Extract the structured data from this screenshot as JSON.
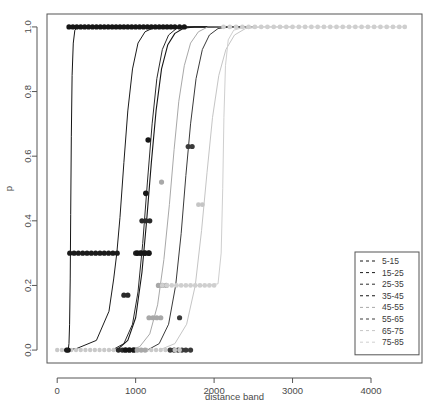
{
  "chart_data": {
    "type": "line",
    "title": "",
    "xlabel": "distance band",
    "ylabel": "p",
    "xlim": [
      -130,
      4650
    ],
    "ylim": [
      -0.04,
      1.04
    ],
    "xticks": [
      0,
      1000,
      2000,
      3000,
      4000
    ],
    "xtick_labels": [
      "0",
      "1000",
      "2000",
      "3000",
      "4000"
    ],
    "yticks": [
      0.0,
      0.2,
      0.4,
      0.6,
      0.8,
      1.0
    ],
    "ytick_labels": [
      "0.0",
      "0.2",
      "0.4",
      "0.6",
      "0.8",
      "1.0"
    ],
    "grid": false,
    "legend_position": "bottom-right",
    "legend_title": "",
    "series": [
      {
        "name": "5-15",
        "color": "#151515",
        "dash": "3,3",
        "linewidth": 1.0,
        "point_color": "#151515",
        "point_size": 2.6,
        "curve": [
          [
            140,
            0.0
          ],
          [
            150,
            0.02
          ],
          [
            158,
            0.08
          ],
          [
            166,
            0.22
          ],
          [
            172,
            0.42
          ],
          [
            180,
            0.66
          ],
          [
            190,
            0.85
          ],
          [
            205,
            0.95
          ],
          [
            225,
            0.99
          ],
          [
            260,
            1.0
          ],
          [
            400,
            1.0
          ],
          [
            900,
            1.0
          ],
          [
            1600,
            1.0
          ],
          [
            2400,
            1.0
          ]
        ],
        "points": [
          [
            150,
            1.0
          ],
          [
            200,
            1.0
          ],
          [
            250,
            1.0
          ],
          [
            300,
            1.0
          ],
          [
            350,
            1.0
          ],
          [
            400,
            1.0
          ],
          [
            450,
            1.0
          ],
          [
            500,
            1.0
          ],
          [
            550,
            1.0
          ],
          [
            600,
            1.0
          ],
          [
            650,
            1.0
          ],
          [
            700,
            1.0
          ],
          [
            750,
            1.0
          ],
          [
            800,
            1.0
          ],
          [
            850,
            1.0
          ],
          [
            900,
            1.0
          ],
          [
            950,
            1.0
          ],
          [
            1000,
            1.0
          ],
          [
            1050,
            1.0
          ],
          [
            1100,
            1.0
          ],
          [
            1150,
            1.0
          ],
          [
            1200,
            1.0
          ],
          [
            1250,
            1.0
          ],
          [
            1300,
            1.0
          ],
          [
            1350,
            1.0
          ],
          [
            1400,
            1.0
          ],
          [
            1450,
            1.0
          ],
          [
            1500,
            1.0
          ],
          [
            1560,
            1.0
          ],
          [
            1620,
            1.0
          ],
          [
            140,
            0.0
          ]
        ]
      },
      {
        "name": "15-25",
        "color": "#1b1b1b",
        "dash": "3,3",
        "linewidth": 1.0,
        "point_color": "#1b1b1b",
        "point_size": 2.6,
        "curve": [
          [
            120,
            0.0
          ],
          [
            250,
            0.005
          ],
          [
            500,
            0.03
          ],
          [
            660,
            0.12
          ],
          [
            720,
            0.22
          ],
          [
            760,
            0.3
          ],
          [
            800,
            0.41
          ],
          [
            850,
            0.58
          ],
          [
            900,
            0.74
          ],
          [
            960,
            0.87
          ],
          [
            1030,
            0.95
          ],
          [
            1120,
            0.985
          ],
          [
            1250,
            1.0
          ],
          [
            1600,
            1.0
          ],
          [
            2200,
            1.0
          ]
        ],
        "points": [
          [
            160,
            0.3
          ],
          [
            215,
            0.3
          ],
          [
            270,
            0.3
          ],
          [
            325,
            0.3
          ],
          [
            380,
            0.3
          ],
          [
            435,
            0.3
          ],
          [
            490,
            0.3
          ],
          [
            545,
            0.3
          ],
          [
            600,
            0.3
          ],
          [
            655,
            0.3
          ],
          [
            710,
            0.3
          ],
          [
            765,
            0.3
          ],
          [
            120,
            0.0
          ]
        ]
      },
      {
        "name": "25-35",
        "color": "#2a2a2a",
        "dash": "3,3",
        "linewidth": 1.0,
        "point_color": "#2a2a2a",
        "point_size": 2.6,
        "curve": [
          [
            700,
            0.0
          ],
          [
            850,
            0.02
          ],
          [
            960,
            0.08
          ],
          [
            1030,
            0.18
          ],
          [
            1090,
            0.33
          ],
          [
            1150,
            0.52
          ],
          [
            1210,
            0.7
          ],
          [
            1270,
            0.84
          ],
          [
            1340,
            0.93
          ],
          [
            1420,
            0.975
          ],
          [
            1520,
            0.995
          ],
          [
            1650,
            1.0
          ],
          [
            2000,
            1.0
          ]
        ],
        "points": [
          [
            850,
            0.17
          ],
          [
            900,
            0.17
          ],
          [
            1080,
            0.4
          ],
          [
            1130,
            0.4
          ],
          [
            1180,
            0.4
          ],
          [
            1000,
            0.3
          ],
          [
            1055,
            0.3
          ],
          [
            1110,
            0.3
          ],
          [
            1165,
            0.3
          ],
          [
            780,
            0.0
          ],
          [
            830,
            0.0
          ]
        ]
      },
      {
        "name": "35-45",
        "color": "#161616",
        "dash": "3,3",
        "linewidth": 1.1,
        "point_color": "#161616",
        "point_size": 2.8,
        "curve": [
          [
            760,
            0.0
          ],
          [
            900,
            0.03
          ],
          [
            1000,
            0.1
          ],
          [
            1080,
            0.24
          ],
          [
            1140,
            0.4
          ],
          [
            1200,
            0.58
          ],
          [
            1260,
            0.74
          ],
          [
            1330,
            0.87
          ],
          [
            1410,
            0.945
          ],
          [
            1500,
            0.98
          ],
          [
            1610,
            0.996
          ],
          [
            1750,
            1.0
          ],
          [
            2050,
            1.0
          ]
        ],
        "points": [
          [
            1160,
            0.65
          ],
          [
            1130,
            0.485
          ],
          [
            1020,
            0.3
          ],
          [
            1070,
            0.3
          ],
          [
            1120,
            0.3
          ],
          [
            1170,
            0.3
          ],
          [
            870,
            0.0
          ],
          [
            920,
            0.0
          ],
          [
            975,
            0.0
          ]
        ]
      },
      {
        "name": "45-55",
        "color": "#a8a8a8",
        "dash": "3,3",
        "linewidth": 1.0,
        "point_color": "#a8a8a8",
        "point_size": 2.6,
        "curve": [
          [
            900,
            0.0
          ],
          [
            1050,
            0.01
          ],
          [
            1180,
            0.05
          ],
          [
            1280,
            0.14
          ],
          [
            1360,
            0.28
          ],
          [
            1430,
            0.45
          ],
          [
            1490,
            0.62
          ],
          [
            1550,
            0.77
          ],
          [
            1620,
            0.88
          ],
          [
            1700,
            0.95
          ],
          [
            1800,
            0.985
          ],
          [
            1920,
            1.0
          ],
          [
            2150,
            1.0
          ]
        ],
        "points": [
          [
            1330,
            0.52
          ],
          [
            1290,
            0.2
          ],
          [
            1340,
            0.2
          ],
          [
            1390,
            0.2
          ],
          [
            1170,
            0.1
          ],
          [
            1220,
            0.1
          ],
          [
            1270,
            0.1
          ],
          [
            1320,
            0.1
          ],
          [
            1020,
            0.0
          ],
          [
            1070,
            0.0
          ],
          [
            1120,
            0.0
          ]
        ]
      },
      {
        "name": "55-65",
        "color": "#3a3a3a",
        "dash": "3,3",
        "linewidth": 1.0,
        "point_color": "#3a3a3a",
        "point_size": 2.6,
        "curve": [
          [
            1150,
            0.0
          ],
          [
            1300,
            0.02
          ],
          [
            1420,
            0.08
          ],
          [
            1510,
            0.2
          ],
          [
            1580,
            0.36
          ],
          [
            1640,
            0.54
          ],
          [
            1700,
            0.7
          ],
          [
            1770,
            0.84
          ],
          [
            1850,
            0.93
          ],
          [
            1940,
            0.975
          ],
          [
            2050,
            0.995
          ],
          [
            2200,
            1.0
          ],
          [
            2500,
            1.0
          ]
        ],
        "points": [
          [
            1670,
            0.63
          ],
          [
            1720,
            0.63
          ],
          [
            1560,
            0.1
          ],
          [
            1440,
            0.0
          ],
          [
            1490,
            0.0
          ],
          [
            1540,
            0.0
          ],
          [
            1590,
            0.0
          ],
          [
            1640,
            0.0
          ],
          [
            1700,
            0.0
          ]
        ]
      },
      {
        "name": "65-75",
        "color": "#c5c5c5",
        "dash": "3,3",
        "linewidth": 1.0,
        "point_color": "#c5c5c5",
        "point_size": 2.4,
        "curve": [
          [
            1300,
            0.0
          ],
          [
            1500,
            0.02
          ],
          [
            1650,
            0.08
          ],
          [
            1760,
            0.2
          ],
          [
            1840,
            0.37
          ],
          [
            1910,
            0.55
          ],
          [
            1980,
            0.72
          ],
          [
            2060,
            0.85
          ],
          [
            2150,
            0.93
          ],
          [
            2260,
            0.975
          ],
          [
            2400,
            0.995
          ],
          [
            2600,
            1.0
          ],
          [
            3000,
            1.0
          ]
        ],
        "points": [
          [
            1800,
            0.45
          ],
          [
            1850,
            0.45
          ],
          [
            1500,
            0.0
          ],
          [
            1560,
            0.0
          ]
        ]
      },
      {
        "name": "75-85",
        "color": "#cfcfcf",
        "dash": "3,3",
        "linewidth": 1.0,
        "point_color": "#cfcfcf",
        "point_size": 2.4,
        "curve": [
          [
            1330,
            0.2
          ],
          [
            1600,
            0.2
          ],
          [
            1900,
            0.2
          ],
          [
            2050,
            0.205
          ],
          [
            2090,
            0.3
          ],
          [
            2110,
            0.5
          ],
          [
            2125,
            0.72
          ],
          [
            2145,
            0.88
          ],
          [
            2180,
            0.96
          ],
          [
            2250,
            0.99
          ],
          [
            2400,
            1.0
          ],
          [
            3200,
            1.0
          ],
          [
            4450,
            1.0
          ]
        ],
        "points": [
          [
            1340,
            0.2
          ],
          [
            1400,
            0.2
          ],
          [
            1460,
            0.2
          ],
          [
            1520,
            0.2
          ],
          [
            1580,
            0.2
          ],
          [
            1640,
            0.2
          ],
          [
            1700,
            0.2
          ],
          [
            1760,
            0.2
          ],
          [
            1820,
            0.2
          ],
          [
            1880,
            0.2
          ],
          [
            1940,
            0.2
          ],
          [
            2000,
            0.2
          ],
          [
            2120,
            1.0
          ],
          [
            2200,
            1.0
          ],
          [
            2280,
            1.0
          ],
          [
            2360,
            1.0
          ],
          [
            2440,
            1.0
          ],
          [
            2520,
            1.0
          ],
          [
            2600,
            1.0
          ],
          [
            2680,
            1.0
          ],
          [
            2760,
            1.0
          ],
          [
            2840,
            1.0
          ],
          [
            2920,
            1.0
          ],
          [
            3000,
            1.0
          ],
          [
            3080,
            1.0
          ],
          [
            3160,
            1.0
          ],
          [
            3240,
            1.0
          ],
          [
            3320,
            1.0
          ],
          [
            3400,
            1.0
          ],
          [
            3480,
            1.0
          ],
          [
            3560,
            1.0
          ],
          [
            3640,
            1.0
          ],
          [
            3720,
            1.0
          ],
          [
            3800,
            1.0
          ],
          [
            3880,
            1.0
          ],
          [
            3960,
            1.0
          ],
          [
            4040,
            1.0
          ],
          [
            4120,
            1.0
          ],
          [
            4200,
            1.0
          ],
          [
            4280,
            1.0
          ],
          [
            4360,
            1.0
          ],
          [
            4430,
            1.0
          ]
        ]
      }
    ],
    "baseline_points": {
      "color": "#c9c9c9",
      "point_size": 2.2,
      "values": [
        [
          0,
          0.0
        ],
        [
          60,
          0.0
        ],
        [
          120,
          0.0
        ],
        [
          180,
          0.0
        ],
        [
          240,
          0.0
        ],
        [
          300,
          0.0
        ],
        [
          360,
          0.0
        ],
        [
          420,
          0.0
        ],
        [
          480,
          0.0
        ],
        [
          540,
          0.0
        ],
        [
          600,
          0.0
        ],
        [
          660,
          0.0
        ],
        [
          720,
          0.0
        ],
        [
          780,
          0.0
        ],
        [
          840,
          0.0
        ],
        [
          900,
          0.0
        ],
        [
          960,
          0.0
        ],
        [
          1020,
          0.0
        ],
        [
          1080,
          0.0
        ],
        [
          1140,
          0.0
        ],
        [
          1200,
          0.0
        ],
        [
          1260,
          0.0
        ],
        [
          1320,
          0.0
        ],
        [
          1380,
          0.0
        ],
        [
          1440,
          0.0
        ],
        [
          1500,
          0.0
        ],
        [
          1560,
          0.0
        ],
        [
          1620,
          0.0
        ],
        [
          1680,
          0.0
        ]
      ]
    }
  }
}
